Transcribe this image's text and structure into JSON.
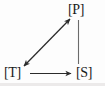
{
  "diagram": {
    "type": "directed-graph",
    "background_color": "#fdfdfd",
    "stroke_color": "#2b2b2b",
    "text_color": "#1a1a1a",
    "nodes": [
      {
        "id": "P",
        "label": "[P]",
        "x": 78,
        "y": 10,
        "position": "top-right"
      },
      {
        "id": "T",
        "label": "[T]",
        "x": 15,
        "y": 73,
        "position": "bottom-left"
      },
      {
        "id": "S",
        "label": "[S]",
        "x": 87,
        "y": 73,
        "position": "bottom-right"
      }
    ],
    "edges": [
      {
        "id": "edge-t-p",
        "from": "T",
        "to": "P",
        "style": "double-arrow",
        "arrowheads": "both",
        "orientation": "diagonal"
      },
      {
        "id": "edge-p-s",
        "from": "P",
        "to": "S",
        "style": "plain-line",
        "arrowheads": "none",
        "orientation": "vertical"
      },
      {
        "id": "edge-t-s",
        "from": "T",
        "to": "S",
        "style": "single-arrow",
        "arrowheads": "end",
        "orientation": "horizontal"
      }
    ]
  }
}
